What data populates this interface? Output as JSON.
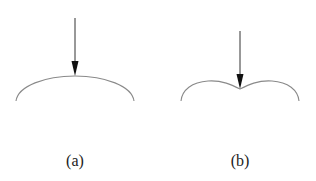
{
  "panels": [
    {
      "id": "a",
      "label": "(a)",
      "description": "smooth convex arc with downward arrow pointing at its apex",
      "arrow": {
        "x": 75,
        "y_start": 18,
        "y_end": 76
      },
      "curve": {
        "shape": "single-arc",
        "left": [
          16,
          101
        ],
        "apex": [
          75,
          76
        ],
        "right": [
          134,
          101
        ]
      }
    },
    {
      "id": "b",
      "label": "(b)",
      "description": "double-lobed curve with a cusp at center, downward arrow pointing at the cusp",
      "arrow": {
        "x": 240,
        "y_start": 31,
        "y_end": 89
      },
      "curve": {
        "shape": "cusped-double-arc",
        "left": [
          181,
          101
        ],
        "cusp": [
          240,
          89
        ],
        "right": [
          299,
          101
        ]
      }
    }
  ],
  "colors": {
    "curve": "#8a8a8a",
    "arrow": "#333333",
    "text": "#222222",
    "background": "#ffffff"
  }
}
